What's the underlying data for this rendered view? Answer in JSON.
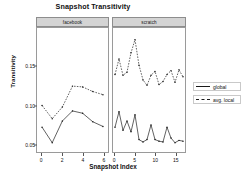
{
  "chart_data": {
    "type": "line",
    "title": "Snapshot Transitivity",
    "xlabel": "Snapshot Index",
    "ylabel": "Transitivity",
    "ylim": [
      0.04,
      0.2
    ],
    "yticks": [
      0.05,
      0.1,
      0.15
    ],
    "ytick_labels": [
      "0.05",
      "0.10",
      "0.15"
    ],
    "grid": false,
    "legend_position": "right",
    "legend": [
      {
        "name": "global",
        "style": "solid"
      },
      {
        "name": "avg. local",
        "style": "dashed"
      }
    ],
    "panels": [
      {
        "label": "facebook",
        "xlim": [
          -0.5,
          6.5
        ],
        "xticks": [
          0,
          2,
          4,
          6
        ],
        "xtick_labels": [
          "0",
          "2",
          "4",
          "6"
        ],
        "x": [
          0,
          1,
          2,
          3,
          4,
          5,
          6
        ],
        "series": [
          {
            "name": "global",
            "style": "solid",
            "values": [
              0.072,
              0.052,
              0.08,
              0.093,
              0.09,
              0.079,
              0.073
            ]
          },
          {
            "name": "avg. local",
            "style": "dashed",
            "values": [
              0.1,
              0.083,
              0.098,
              0.125,
              0.124,
              0.118,
              0.114
            ]
          }
        ]
      },
      {
        "label": "scratch",
        "xlim": [
          -0.5,
          17.5
        ],
        "xticks": [
          0,
          5,
          10,
          15
        ],
        "xtick_labels": [
          "0",
          "5",
          "10",
          "15"
        ],
        "x": [
          0,
          1,
          2,
          3,
          4,
          5,
          6,
          7,
          8,
          9,
          10,
          11,
          12,
          13,
          14,
          15,
          16,
          17
        ],
        "series": [
          {
            "name": "global",
            "style": "solid",
            "values": [
              0.072,
              0.092,
              0.068,
              0.08,
              0.066,
              0.088,
              0.056,
              0.053,
              0.056,
              0.075,
              0.056,
              0.054,
              0.053,
              0.072,
              0.058,
              0.052,
              0.055,
              0.054
            ]
          },
          {
            "name": "avg. local",
            "style": "dashed",
            "values": [
              0.14,
              0.16,
              0.139,
              0.143,
              0.168,
              0.185,
              0.152,
              0.133,
              0.126,
              0.139,
              0.144,
              0.127,
              0.131,
              0.14,
              0.145,
              0.13,
              0.146,
              0.137
            ]
          }
        ]
      }
    ]
  }
}
